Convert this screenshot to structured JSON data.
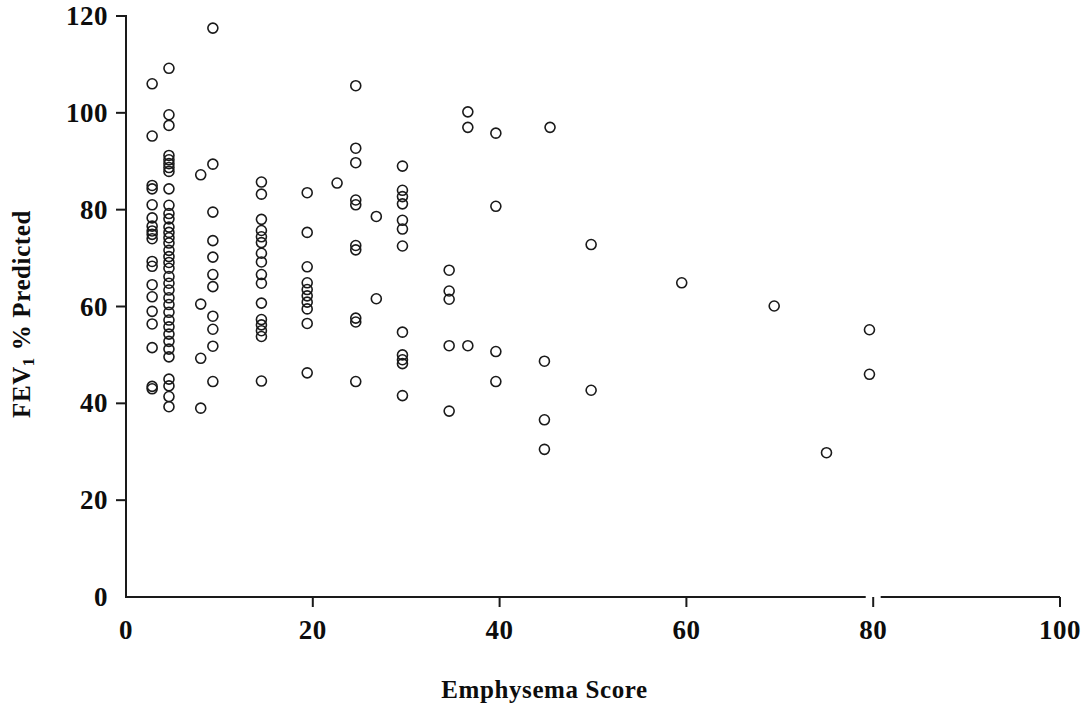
{
  "figure": {
    "background_color": "#ffffff",
    "ink_color": "#1a1a1a"
  },
  "axes": {
    "x_title": "Emphysema Score",
    "y_title_main": "FEV",
    "y_title_sub": "1",
    "y_title_rest": " % Predicted",
    "y_title_full": "FEV1 % Predicted"
  },
  "chart_data": {
    "type": "scatter",
    "title": "",
    "xlabel": "Emphysema Score",
    "ylabel": "FEV1 % Predicted",
    "xlim": [
      0,
      100
    ],
    "ylim": [
      0,
      120
    ],
    "xticks": [
      0,
      20,
      40,
      60,
      80,
      100
    ],
    "yticks": [
      0,
      20,
      40,
      60,
      80,
      100,
      120
    ],
    "xtick_labels": [
      "0",
      "20",
      "40",
      "60",
      "80",
      "100"
    ],
    "ytick_labels": [
      "0",
      "20",
      "40",
      "60",
      "80",
      "100",
      "120"
    ],
    "grid": false,
    "legend": null,
    "marker": {
      "shape": "circle",
      "fill": "none",
      "edge_color": "#1a1a1a",
      "size_px": 10,
      "line_width_px": 1.6
    },
    "series": [
      {
        "name": "Subjects",
        "points": [
          [
            2.8,
            106.0
          ],
          [
            2.8,
            95.2
          ],
          [
            2.8,
            85.0
          ],
          [
            2.8,
            84.3
          ],
          [
            2.8,
            81.0
          ],
          [
            2.8,
            78.3
          ],
          [
            2.8,
            76.6
          ],
          [
            2.8,
            75.6
          ],
          [
            2.8,
            74.9
          ],
          [
            2.8,
            74.0
          ],
          [
            2.8,
            69.3
          ],
          [
            2.8,
            68.3
          ],
          [
            2.8,
            64.5
          ],
          [
            2.8,
            62.0
          ],
          [
            2.8,
            59.0
          ],
          [
            2.8,
            56.4
          ],
          [
            2.8,
            51.5
          ],
          [
            2.8,
            43.5
          ],
          [
            2.8,
            43.0
          ],
          [
            4.6,
            109.2
          ],
          [
            4.6,
            99.6
          ],
          [
            4.6,
            97.4
          ],
          [
            4.6,
            91.2
          ],
          [
            4.6,
            90.3
          ],
          [
            4.6,
            89.5
          ],
          [
            4.6,
            88.7
          ],
          [
            4.6,
            87.9
          ],
          [
            4.6,
            84.3
          ],
          [
            4.6,
            80.9
          ],
          [
            4.6,
            79.2
          ],
          [
            4.6,
            78.1
          ],
          [
            4.6,
            76.4
          ],
          [
            4.6,
            75.3
          ],
          [
            4.6,
            74.2
          ],
          [
            4.6,
            73.1
          ],
          [
            4.6,
            71.6
          ],
          [
            4.6,
            70.3
          ],
          [
            4.6,
            69.1
          ],
          [
            4.6,
            67.9
          ],
          [
            4.6,
            66.2
          ],
          [
            4.6,
            64.8
          ],
          [
            4.6,
            63.4
          ],
          [
            4.6,
            61.8
          ],
          [
            4.6,
            60.4
          ],
          [
            4.6,
            58.8
          ],
          [
            4.6,
            57.2
          ],
          [
            4.6,
            55.8
          ],
          [
            4.6,
            54.3
          ],
          [
            4.6,
            52.8
          ],
          [
            4.6,
            51.2
          ],
          [
            4.6,
            49.6
          ],
          [
            4.6,
            45.0
          ],
          [
            4.6,
            43.6
          ],
          [
            4.6,
            41.4
          ],
          [
            4.6,
            39.3
          ],
          [
            8.0,
            87.2
          ],
          [
            8.0,
            60.5
          ],
          [
            8.0,
            49.3
          ],
          [
            8.0,
            39.0
          ],
          [
            9.3,
            117.5
          ],
          [
            9.3,
            89.4
          ],
          [
            9.3,
            79.5
          ],
          [
            9.3,
            73.6
          ],
          [
            9.3,
            70.2
          ],
          [
            9.3,
            66.6
          ],
          [
            9.3,
            64.1
          ],
          [
            9.3,
            58.0
          ],
          [
            9.3,
            55.3
          ],
          [
            9.3,
            51.8
          ],
          [
            9.3,
            44.5
          ],
          [
            14.5,
            85.7
          ],
          [
            14.5,
            83.2
          ],
          [
            14.5,
            78.0
          ],
          [
            14.5,
            75.7
          ],
          [
            14.5,
            74.4
          ],
          [
            14.5,
            73.2
          ],
          [
            14.5,
            71.0
          ],
          [
            14.5,
            69.2
          ],
          [
            14.5,
            66.6
          ],
          [
            14.5,
            64.8
          ],
          [
            14.5,
            60.7
          ],
          [
            14.5,
            57.3
          ],
          [
            14.5,
            56.2
          ],
          [
            14.5,
            55.0
          ],
          [
            14.5,
            53.8
          ],
          [
            14.5,
            44.6
          ],
          [
            19.4,
            83.5
          ],
          [
            19.4,
            75.3
          ],
          [
            19.4,
            68.2
          ],
          [
            19.4,
            64.9
          ],
          [
            19.4,
            63.5
          ],
          [
            19.4,
            62.2
          ],
          [
            19.4,
            60.9
          ],
          [
            19.4,
            59.5
          ],
          [
            19.4,
            56.5
          ],
          [
            19.4,
            46.3
          ],
          [
            22.6,
            85.5
          ],
          [
            24.6,
            105.6
          ],
          [
            24.6,
            92.7
          ],
          [
            24.6,
            89.7
          ],
          [
            24.6,
            82.0
          ],
          [
            24.6,
            81.0
          ],
          [
            24.6,
            72.6
          ],
          [
            24.6,
            71.7
          ],
          [
            24.6,
            57.6
          ],
          [
            24.6,
            56.8
          ],
          [
            24.6,
            44.5
          ],
          [
            26.8,
            78.6
          ],
          [
            26.8,
            61.6
          ],
          [
            29.6,
            89.0
          ],
          [
            29.6,
            84.0
          ],
          [
            29.6,
            82.7
          ],
          [
            29.6,
            81.2
          ],
          [
            29.6,
            77.8
          ],
          [
            29.6,
            76.0
          ],
          [
            29.6,
            72.5
          ],
          [
            29.6,
            54.7
          ],
          [
            29.6,
            50.0
          ],
          [
            29.6,
            49.0
          ],
          [
            29.6,
            48.2
          ],
          [
            29.6,
            41.6
          ],
          [
            34.6,
            67.5
          ],
          [
            34.6,
            63.2
          ],
          [
            34.6,
            61.5
          ],
          [
            34.6,
            51.9
          ],
          [
            34.6,
            38.4
          ],
          [
            36.6,
            100.2
          ],
          [
            36.6,
            97.0
          ],
          [
            36.6,
            51.9
          ],
          [
            39.6,
            95.8
          ],
          [
            39.6,
            80.7
          ],
          [
            39.6,
            50.7
          ],
          [
            39.6,
            44.5
          ],
          [
            44.8,
            48.7
          ],
          [
            44.8,
            36.6
          ],
          [
            44.8,
            30.5
          ],
          [
            45.4,
            97.0
          ],
          [
            49.8,
            72.8
          ],
          [
            49.8,
            42.7
          ],
          [
            59.5,
            64.9
          ],
          [
            69.4,
            60.1
          ],
          [
            75.0,
            29.8
          ],
          [
            79.6,
            55.2
          ],
          [
            79.6,
            46.0
          ]
        ]
      }
    ],
    "n_points": 146
  }
}
